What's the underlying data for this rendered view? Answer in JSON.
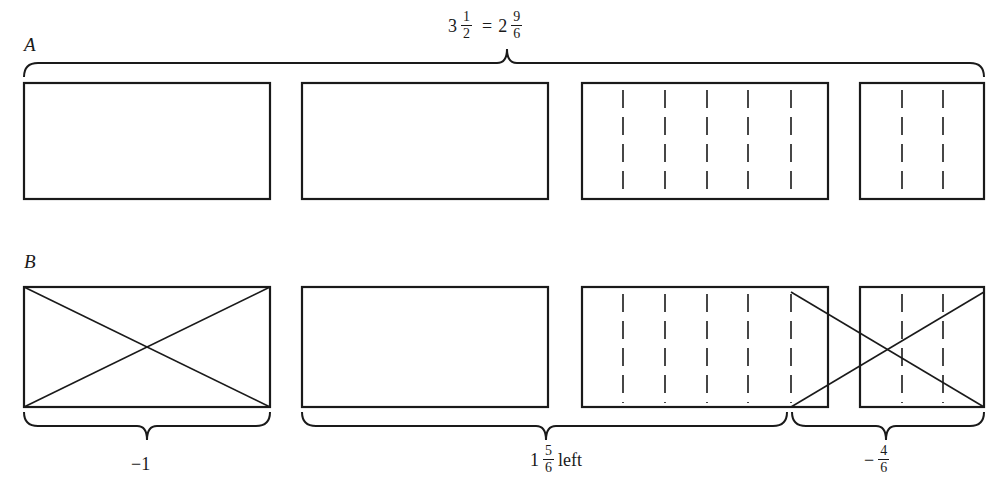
{
  "figure": {
    "top_equation": {
      "whole_left": "3",
      "frac_left": {
        "num": "1",
        "den": "2"
      },
      "equals": "=",
      "whole_right": "2",
      "frac_right": {
        "num": "9",
        "den": "6"
      }
    },
    "row_a": {
      "label": "A",
      "rects": [
        {
          "x": 24,
          "y": 83,
          "w": 246,
          "h": 116,
          "dashes": []
        },
        {
          "x": 302,
          "y": 83,
          "w": 246,
          "h": 116,
          "dashes": []
        },
        {
          "x": 582,
          "y": 83,
          "w": 246,
          "h": 116,
          "dashes": [
            623,
            665,
            707,
            748,
            791
          ]
        },
        {
          "x": 860,
          "y": 83,
          "w": 124,
          "h": 116,
          "dashes": [
            902,
            943
          ]
        }
      ],
      "brace": {
        "x1": 24,
        "x2": 984,
        "y": 63,
        "tip_x": 507,
        "direction": "up"
      }
    },
    "row_b": {
      "label": "B",
      "rects": [
        {
          "x": 24,
          "y": 287,
          "w": 246,
          "h": 120,
          "dashes": [],
          "crossed": true
        },
        {
          "x": 302,
          "y": 287,
          "w": 246,
          "h": 120,
          "dashes": []
        },
        {
          "x": 582,
          "y": 287,
          "w": 246,
          "h": 120,
          "dashes": [
            623,
            665,
            707,
            748,
            791
          ]
        },
        {
          "x": 860,
          "y": 287,
          "w": 124,
          "h": 120,
          "dashes": [
            902,
            943
          ]
        }
      ],
      "cross_out_span": {
        "x1": 791,
        "x2": 984,
        "y1": 292,
        "y2": 407
      },
      "braces": [
        {
          "x1": 24,
          "x2": 270,
          "y": 426,
          "tip_x": 147,
          "label": "−1"
        },
        {
          "x1": 302,
          "x2": 787,
          "y": 426,
          "tip_x": 546,
          "label": "1 5/6 left"
        },
        {
          "x1": 792,
          "x2": 984,
          "y": 426,
          "tip_x": 886,
          "label": "−4/6"
        }
      ],
      "label_minus_one": "−1",
      "label_remaining": {
        "whole": "1",
        "num": "5",
        "den": "6",
        "suffix": "left"
      },
      "label_removed": {
        "sign": "−",
        "num": "4",
        "den": "6"
      }
    },
    "colors": {
      "ink": "#1a1a1a",
      "background": "#ffffff"
    }
  }
}
